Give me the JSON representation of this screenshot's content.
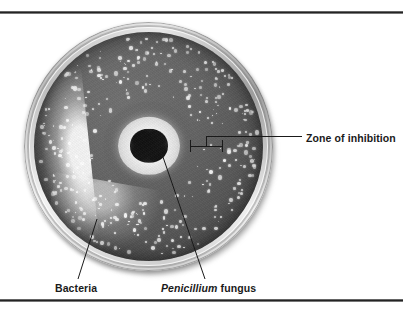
{
  "figure": {
    "type": "photograph",
    "background_color": "#ffffff",
    "rule_color": "#1c1c1c"
  },
  "labels": {
    "zone_of_inhibition": "Zone of inhibition",
    "bacteria": "Bacteria",
    "fungus_genus": "Penicillium",
    "fungus_rest": " fungus"
  },
  "photo": {
    "dish": {
      "agar_color": "#5c5c5c",
      "rim_color": "#d8d8d8",
      "colony_color": "#f3f3f3"
    },
    "fungus": {
      "halo_color": "#f2f2f2",
      "core_color": "#141414"
    }
  },
  "chart_data": {
    "type": "table",
    "annotations": [
      {
        "label": "Zone of inhibition",
        "target": "clear ring around central fungal colony",
        "leader": "horizontal line with caliper bracket, right side"
      },
      {
        "label": "Bacteria",
        "target": "white colonies scattered across agar",
        "leader": "diagonal line, lower left"
      },
      {
        "label": "Penicillium fungus",
        "target": "dark blotchy colony at dish center",
        "leader": "diagonal line, lower center"
      }
    ]
  }
}
